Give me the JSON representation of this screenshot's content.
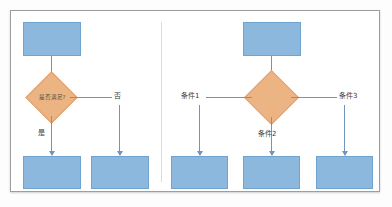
{
  "figure": {
    "background_color": "#ffffff",
    "frame_border_color": "#9e9e9e",
    "box_fill_color": "#8db8dd",
    "box_border_color": "#6fa3d0",
    "diamond_fill_color": "#edb483",
    "diamond_border_color": "#e0a06c",
    "connector_color": "#6f95bb"
  },
  "left_panel": {
    "name": "binary-decision-example",
    "start_node": {
      "label": ""
    },
    "decision": {
      "label": "是否满足?"
    },
    "branches": [
      {
        "label": "是",
        "target": {
          "label": ""
        }
      },
      {
        "label": "否",
        "target": {
          "label": ""
        }
      }
    ]
  },
  "right_panel": {
    "name": "multi-branch-decision-example",
    "start_node": {
      "label": ""
    },
    "decision": {
      "label": ""
    },
    "branches": [
      {
        "label": "条件1",
        "target": {
          "label": ""
        }
      },
      {
        "label": "条件2",
        "target": {
          "label": ""
        }
      },
      {
        "label": "条件3",
        "target": {
          "label": ""
        }
      }
    ]
  }
}
